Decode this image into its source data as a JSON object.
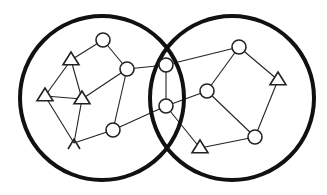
{
  "diagram": {
    "type": "venn-network",
    "sets": [
      {
        "id": "left-set",
        "cx": 102,
        "cy": 98,
        "r": 82
      },
      {
        "id": "right-set",
        "cx": 232,
        "cy": 98,
        "r": 82
      }
    ],
    "nodes": [
      {
        "id": "c1",
        "shape": "circle",
        "x": 103,
        "y": 40
      },
      {
        "id": "c2",
        "shape": "circle",
        "x": 127,
        "y": 69
      },
      {
        "id": "t1",
        "shape": "triangle",
        "x": 71,
        "y": 60
      },
      {
        "id": "t2",
        "shape": "triangle",
        "x": 45,
        "y": 96
      },
      {
        "id": "t3",
        "shape": "triangle",
        "x": 82,
        "y": 99
      },
      {
        "id": "t4",
        "shape": "arrowhead",
        "x": 74,
        "y": 143
      },
      {
        "id": "c3",
        "shape": "circle",
        "x": 113,
        "y": 130
      },
      {
        "id": "c4",
        "shape": "circle",
        "x": 166,
        "y": 65
      },
      {
        "id": "c5",
        "shape": "circle",
        "x": 166,
        "y": 106
      },
      {
        "id": "c6",
        "shape": "circle",
        "x": 239,
        "y": 47
      },
      {
        "id": "c7",
        "shape": "circle",
        "x": 207,
        "y": 91
      },
      {
        "id": "t5",
        "shape": "triangle",
        "x": 278,
        "y": 80
      },
      {
        "id": "c8",
        "shape": "circle",
        "x": 255,
        "y": 137
      },
      {
        "id": "t6",
        "shape": "triangle",
        "x": 200,
        "y": 148
      }
    ],
    "edges": [
      [
        "t1",
        "c1"
      ],
      [
        "c1",
        "c2"
      ],
      [
        "t1",
        "t2"
      ],
      [
        "t1",
        "t3"
      ],
      [
        "t2",
        "t3"
      ],
      [
        "t3",
        "c2"
      ],
      [
        "t2",
        "t4"
      ],
      [
        "t3",
        "t4"
      ],
      [
        "t4",
        "c3"
      ],
      [
        "c3",
        "c2"
      ],
      [
        "c3",
        "c5"
      ],
      [
        "c2",
        "c4"
      ],
      [
        "c4",
        "c5"
      ],
      [
        "c4",
        "c6"
      ],
      [
        "c5",
        "c7"
      ],
      [
        "c5",
        "t6"
      ],
      [
        "c6",
        "c7"
      ],
      [
        "c6",
        "t5"
      ],
      [
        "t5",
        "c8"
      ],
      [
        "c7",
        "c8"
      ],
      [
        "c8",
        "t6"
      ]
    ],
    "colors": {
      "stroke": "#111111",
      "fill": "#ffffff",
      "background": "#ffffff"
    }
  }
}
